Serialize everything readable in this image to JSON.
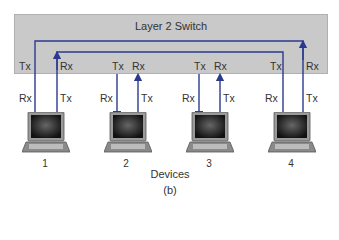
{
  "switch": {
    "title": "Layer 2 Switch",
    "fill_color": "#c9c9c9",
    "port_labels": [
      {
        "port": 1,
        "left": "Tx",
        "right": "Rx"
      },
      {
        "port": 2,
        "left": "Tx",
        "right": "Rx"
      },
      {
        "port": 3,
        "left": "Tx",
        "right": "Rx"
      },
      {
        "port": 4,
        "left": "Tx",
        "right": "Rx"
      }
    ]
  },
  "devices": [
    {
      "number": "1",
      "left_label": "Rx",
      "right_label": "Tx",
      "icon": "laptop-icon"
    },
    {
      "number": "2",
      "left_label": "Rx",
      "right_label": "Tx",
      "icon": "laptop-icon"
    },
    {
      "number": "3",
      "left_label": "Rx",
      "right_label": "Tx",
      "icon": "laptop-icon"
    },
    {
      "number": "4",
      "left_label": "Rx",
      "right_label": "Tx",
      "icon": "laptop-icon"
    }
  ],
  "connections": [
    {
      "from": "device 4 Tx",
      "to": "device 1 Rx",
      "path": "outer"
    },
    {
      "from": "device 1 Tx",
      "to": "device 4 Rx",
      "path": "inner"
    },
    {
      "from": "device 2 Tx",
      "to": "device 2 Rx (switch port)",
      "path": "port"
    },
    {
      "from": "device 3 Tx",
      "to": "device 3 Rx (switch port)",
      "path": "port"
    }
  ],
  "wire_color": "#2b3a8f",
  "caption": {
    "label": "Devices",
    "subfigure": "(b)"
  }
}
